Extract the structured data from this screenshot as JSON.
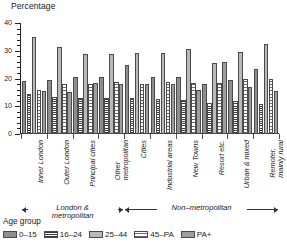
{
  "chart_data": {
    "type": "bar",
    "title": "Percentage",
    "ylabel": "Percentage",
    "xlabel": "",
    "ylim": [
      0,
      40
    ],
    "yticks": [
      0,
      10,
      20,
      30,
      40
    ],
    "grid": false,
    "legend_position": "bottom",
    "legend_title": "Age group",
    "categories": [
      "Inner London",
      "Outer London",
      "Principal cities",
      "Other metropolitan",
      "Cities",
      "Industrial areas",
      "New Towns",
      "Resort etc.",
      "Urban & mixed",
      "Remoter, mainly rural"
    ],
    "series": [
      {
        "name": "0–15",
        "values": [
          19.2,
          19.5,
          20.5,
          20.5,
          24.7,
          20.6,
          20.5,
          17.9,
          19.4,
          23.5
        ]
      },
      {
        "name": "16–24",
        "values": [
          14.4,
          13.2,
          12.9,
          12.8,
          12.8,
          12.7,
          12.4,
          11.1,
          12.0,
          10.7
        ]
      },
      {
        "name": "25–44",
        "values": [
          34.9,
          31.4,
          28.9,
          28.9,
          29.3,
          29.3,
          30.7,
          25.5,
          29.6,
          32.6
        ]
      },
      {
        "name": "45–PA",
        "values": [
          15.9,
          18.0,
          18.2,
          18.6,
          18.0,
          18.9,
          18.4,
          18.4,
          19.8,
          19.8
        ]
      },
      {
        "name": "PA+",
        "values": [
          15.5,
          15.1,
          18.5,
          18.1,
          17.9,
          17.9,
          15.9,
          25.9,
          16.9,
          15.4
        ]
      }
    ],
    "series_colors": [
      "#8e8e8e",
      "#ffffff",
      "#b9b9b9",
      "#ffffff",
      "#9e9e9e"
    ],
    "groups": [
      {
        "label": "London & metropolitan",
        "label_lines": [
          "London &",
          "metropolitan"
        ],
        "span": [
          0,
          3
        ]
      },
      {
        "label": "Non–metropolitan",
        "label_lines": [
          "Non–metropolitan"
        ],
        "span": [
          4,
          9
        ]
      }
    ]
  },
  "axis": {
    "tick_labels": [
      "40",
      "30",
      "20",
      "10",
      "0"
    ]
  },
  "legend": {
    "title": "Age group",
    "items": [
      {
        "label": "0–15",
        "swatch": "solid-dark-gray"
      },
      {
        "label": "16–24",
        "swatch": "checkered"
      },
      {
        "label": "25–44",
        "swatch": "solid-light-gray"
      },
      {
        "label": "45–PA",
        "swatch": "dotted-white"
      },
      {
        "label": "PA+",
        "swatch": "solid-medium-gray"
      }
    ]
  }
}
